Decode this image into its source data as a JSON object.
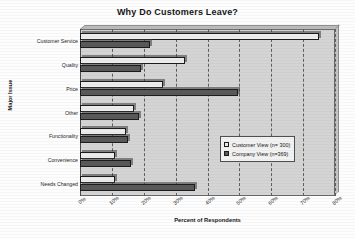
{
  "chart_data": {
    "type": "bar",
    "orientation": "horizontal",
    "title": "Why Do Customers Leave?",
    "xlabel": "Percent of Respondents",
    "ylabel": "Major Issue",
    "xlim": [
      0,
      80
    ],
    "xtick_step": 10,
    "xtick_labels": [
      "0%",
      "10%",
      "20%",
      "30%",
      "40%",
      "50%",
      "60%",
      "70%",
      "80%"
    ],
    "grid": true,
    "grid_axis": "x",
    "legend_position": "center-right",
    "categories": [
      "Customer Service",
      "Quality",
      "Price",
      "Other",
      "Functionality",
      "Convenience",
      "Needs Changed"
    ],
    "series": [
      {
        "name": "Customer View (n= 300)",
        "color": "#ececec",
        "values": [
          75,
          33,
          26,
          17,
          14.5,
          11,
          11
        ]
      },
      {
        "name": "Company View (n=369)",
        "color": "#595959",
        "values": [
          22,
          19,
          49.5,
          18.5,
          15,
          16,
          36
        ]
      }
    ]
  },
  "legend": {
    "entries": [
      {
        "label": "Customer View (n= 300)"
      },
      {
        "label": "Company View (n=369)"
      }
    ]
  }
}
